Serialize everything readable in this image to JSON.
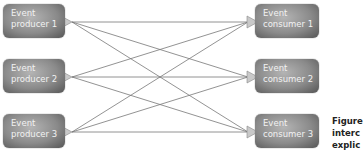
{
  "producers": [
    {
      "label": "Event\nproducer 1"
    },
    {
      "label": "Event\nproducer 2"
    },
    {
      "label": "Event\nproducer 3"
    }
  ],
  "consumers": [
    {
      "label": "Event\nconsumer 1"
    },
    {
      "label": "Event\nconsumer 2"
    },
    {
      "label": "Event\nconsumer 3"
    }
  ],
  "caption": {
    "lines": [
      "Figure",
      "interc",
      "explic"
    ]
  },
  "connections": "every producer connects to every consumer (3x3)"
}
